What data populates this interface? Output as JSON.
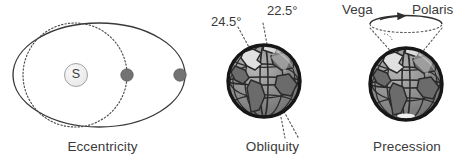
{
  "figure": {
    "background_color": "#ffffff",
    "line_color": "#3a3a3a",
    "panels": [
      {
        "id": "eccentricity",
        "caption": "Eccentricity",
        "sun_label": "S",
        "elements": [
          "solid-ellipse-orbit",
          "dotted-circle-orbit",
          "sun-marker",
          "planet-marker-inner",
          "planet-marker-outer"
        ]
      },
      {
        "id": "obliquity",
        "caption": "Obliquity",
        "angles": [
          "24.5°",
          "22.5°"
        ],
        "elements": [
          "earth-globe",
          "dotted-axis-line-245",
          "dotted-axis-line-225"
        ]
      },
      {
        "id": "precession",
        "caption": "Precession",
        "stars": [
          "Vega",
          "Polaris"
        ],
        "elements": [
          "earth-globe",
          "precession-cone",
          "precession-ellipse",
          "rotation-arrow"
        ]
      }
    ]
  },
  "colors": {
    "outline": "#3a3a3a",
    "dark_outline": "#1c1c1c",
    "planet_fill": "#7a7a7a",
    "sun_fill": "#f0f0f0",
    "globe_ocean": "#8c8c8c",
    "globe_land": "#6a6a6a",
    "globe_highlight": "#d5d5d5",
    "text": "#3a3a3a"
  },
  "eccentricity": {
    "caption": "Eccentricity",
    "sun_label": "S"
  },
  "obliquity": {
    "caption": "Obliquity",
    "angle_high": "24.5°",
    "angle_low": "22.5°"
  },
  "precession": {
    "caption": "Precession",
    "star_left": "Vega",
    "star_right": "Polaris"
  }
}
